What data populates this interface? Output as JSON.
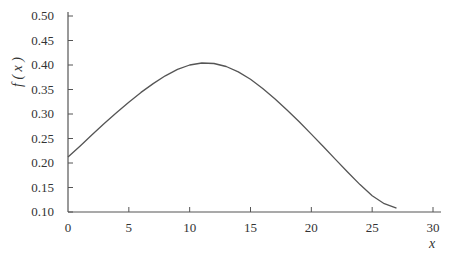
{
  "chart_data": {
    "type": "line",
    "title": "",
    "xlabel": "x",
    "ylabel": "f ( x )",
    "xlim": [
      0,
      30
    ],
    "ylim": [
      0.1,
      0.5
    ],
    "x_ticks": [
      "0",
      "5",
      "10",
      "15",
      "20",
      "25",
      "30"
    ],
    "y_ticks": [
      "0.10",
      "0.15",
      "0.20",
      "0.25",
      "0.30",
      "0.35",
      "0.40",
      "0.45",
      "0.50"
    ],
    "grid": false,
    "legend": null,
    "series": [
      {
        "name": "f(x)",
        "color": "#555555",
        "x": [
          0,
          1,
          2,
          3,
          4,
          5,
          6,
          7,
          8,
          9,
          10,
          11,
          12,
          13,
          14,
          15,
          16,
          17,
          18,
          19,
          20,
          21,
          22,
          23,
          24,
          25,
          26,
          27
        ],
        "y": [
          0.212,
          0.235,
          0.258,
          0.281,
          0.303,
          0.324,
          0.344,
          0.362,
          0.378,
          0.391,
          0.4,
          0.404,
          0.403,
          0.397,
          0.386,
          0.371,
          0.352,
          0.331,
          0.308,
          0.284,
          0.259,
          0.233,
          0.207,
          0.181,
          0.156,
          0.133,
          0.117,
          0.108
        ]
      }
    ]
  }
}
